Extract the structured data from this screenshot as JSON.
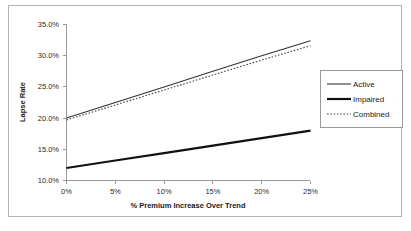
{
  "chart_data": {
    "type": "line",
    "title": "",
    "xlabel": "% Premium Increase Over Trend",
    "ylabel": "Lapse Rate",
    "x": [
      0,
      5,
      10,
      15,
      20,
      25
    ],
    "xticklabels": [
      "0%",
      "5%",
      "10%",
      "15%",
      "20%",
      "25%"
    ],
    "yticklabels": [
      "10.0%",
      "15.0%",
      "20.0%",
      "25.0%",
      "30.0%",
      "35.0%"
    ],
    "yticks": [
      10,
      15,
      20,
      25,
      30,
      35
    ],
    "xlim": [
      0,
      25
    ],
    "ylim": [
      10,
      35
    ],
    "grid": false,
    "legend_position": "right",
    "series": [
      {
        "name": "Active",
        "style": "solid-thin",
        "values": [
          20.0,
          22.5,
          25.0,
          27.5,
          30.0,
          32.4
        ]
      },
      {
        "name": "Impaired",
        "style": "solid-thick",
        "values": [
          12.0,
          13.2,
          14.4,
          15.6,
          16.8,
          18.0
        ]
      },
      {
        "name": "Combined",
        "style": "dotted",
        "values": [
          19.7,
          22.1,
          24.5,
          26.9,
          29.3,
          31.6
        ]
      }
    ]
  },
  "legend": {
    "items": [
      {
        "label": "Active",
        "style": "solid-thin"
      },
      {
        "label": "Impaired",
        "style": "solid-thick"
      },
      {
        "label": "Combined",
        "style": "dotted"
      }
    ]
  },
  "colors": {
    "active": "#333333",
    "impaired": "#111111",
    "combined": "#444444",
    "axis": "#9a9a9a",
    "frame": "#b5b5b5",
    "background": "#ffffff"
  }
}
